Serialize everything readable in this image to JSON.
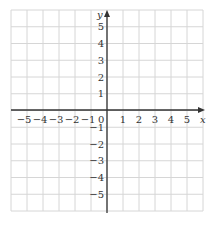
{
  "diagram": {
    "type": "coordinate-grid",
    "x_axis_label": "x",
    "y_axis_label": "y",
    "origin_label": "0",
    "x_ticks": [
      "−5",
      "−4",
      "−3",
      "−2",
      "−1",
      "1",
      "2",
      "3",
      "4",
      "5"
    ],
    "y_ticks_positive": [
      "1",
      "2",
      "3",
      "4",
      "5"
    ],
    "y_ticks_negative": [
      "−1",
      "−2",
      "−3",
      "−4",
      "−5"
    ],
    "x_range": [
      -6,
      6
    ],
    "y_range": [
      -6,
      6
    ],
    "grid": true,
    "colors": {
      "grid": "#d6d6d6",
      "axis": "#333333"
    }
  }
}
